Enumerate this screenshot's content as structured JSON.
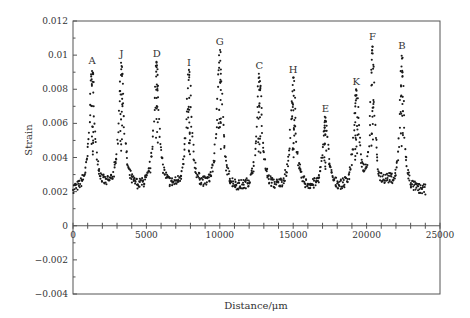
{
  "chart_data": {
    "type": "scatter",
    "title": "",
    "xlabel": "Distance/μm",
    "ylabel": "Strain",
    "xlim": [
      0,
      25000
    ],
    "ylim": [
      -0.004,
      0.012
    ],
    "x_ticks": [
      0,
      5000,
      10000,
      15000,
      20000,
      25000
    ],
    "x_tick_labels": [
      "0",
      "5000",
      "10000",
      "15000",
      "20000",
      "25000"
    ],
    "y_ticks": [
      -0.004,
      -0.002,
      0,
      0.002,
      0.004,
      0.006,
      0.008,
      0.01,
      0.012
    ],
    "y_tick_labels": [
      "−0.004",
      "−0.002",
      "0",
      "0.002",
      "0.004",
      "0.006",
      "0.008",
      "0.01",
      "0.012"
    ],
    "grid": false,
    "legend": null,
    "baseline_strain": 0.002,
    "data_x_range": [
      0,
      24000
    ],
    "peaks": [
      {
        "label": "A",
        "x": 1300,
        "strain": 0.009
      },
      {
        "label": "J",
        "x": 3300,
        "strain": 0.0094
      },
      {
        "label": "D",
        "x": 5700,
        "strain": 0.0094
      },
      {
        "label": "I",
        "x": 7900,
        "strain": 0.0089
      },
      {
        "label": "G",
        "x": 10000,
        "strain": 0.0101
      },
      {
        "label": "C",
        "x": 12700,
        "strain": 0.0087
      },
      {
        "label": "H",
        "x": 15000,
        "strain": 0.0085
      },
      {
        "label": "E",
        "x": 17200,
        "strain": 0.0062
      },
      {
        "label": "K",
        "x": 19300,
        "strain": 0.0078
      },
      {
        "label": "F",
        "x": 20400,
        "strain": 0.0104
      },
      {
        "label": "B",
        "x": 22400,
        "strain": 0.0099
      }
    ],
    "series": [
      {
        "name": "Strain",
        "marker": "dot",
        "color": "#1a1a1a"
      }
    ]
  },
  "colors": {
    "axis": "#555555",
    "points": "#1a1a1a",
    "text": "#333333"
  }
}
